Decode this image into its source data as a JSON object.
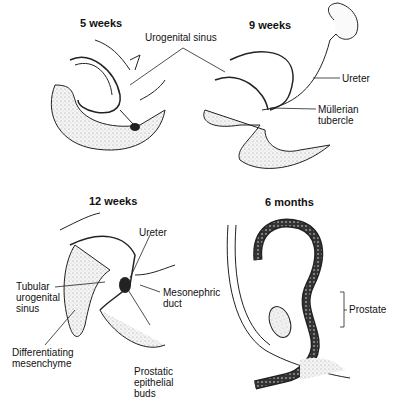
{
  "figure": {
    "panels": [
      {
        "id": "5wk",
        "title": "5 weeks"
      },
      {
        "id": "9wk",
        "title": "9 weeks"
      },
      {
        "id": "12wk",
        "title": "12 weeks"
      },
      {
        "id": "6mo",
        "title": "6 months"
      }
    ],
    "labels": {
      "urogenital_sinus": "Urogenital sinus",
      "ureter_9wk": "Ureter",
      "mullerian_tubercle": "Müllerian\ntubercle",
      "ureter_12wk": "Ureter",
      "tubular_urogenital_sinus": "Tubular\nurogenital\nsinus",
      "mesonephric_duct": "Mesonephric\nduct",
      "differentiating_mesenchyme": "Differentiating\nmesenchyme",
      "prostatic_epithelial_buds": "Prostatic\nepithelial\nbuds",
      "prostate": "Prostate"
    }
  }
}
